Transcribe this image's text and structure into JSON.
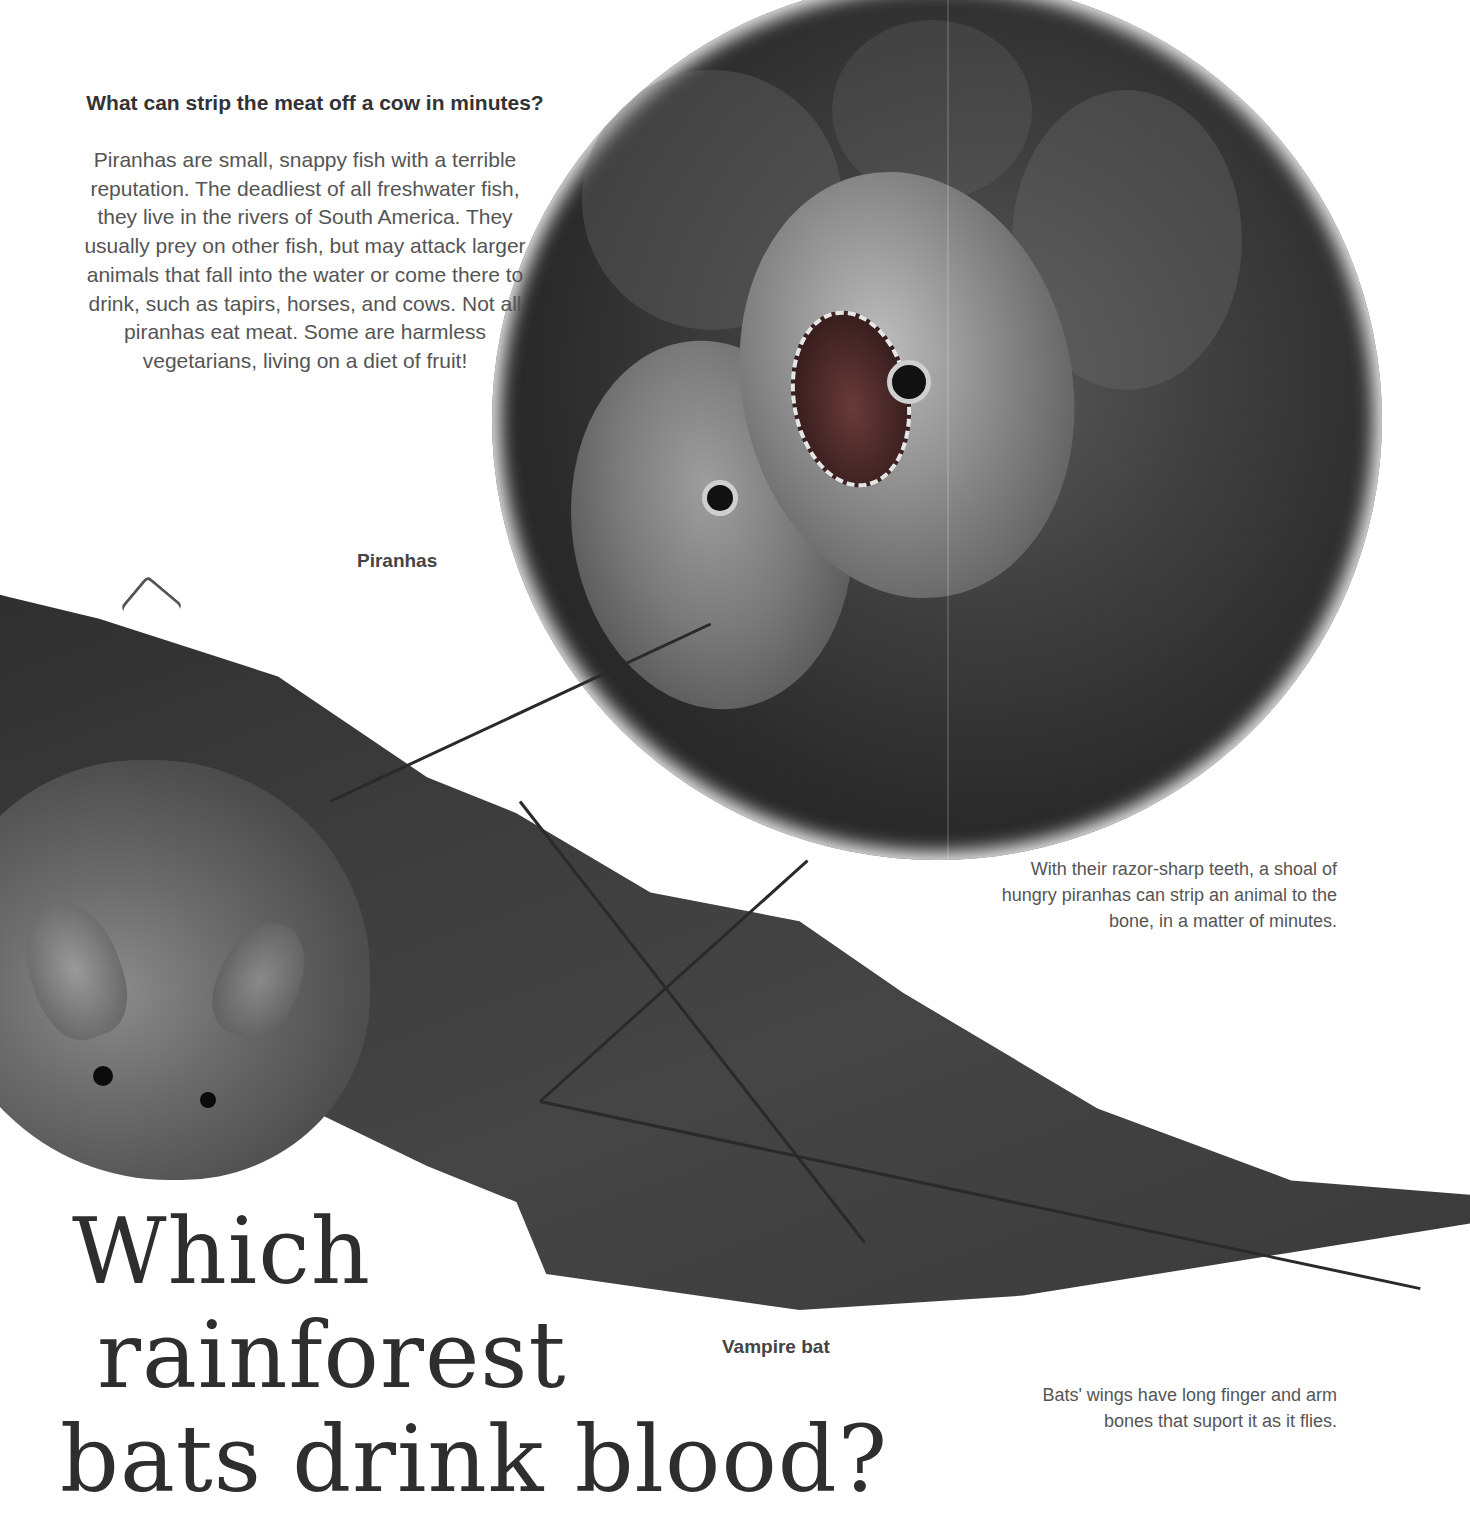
{
  "page": {
    "section": "rainforest animals",
    "piranha_question": {
      "heading": "What can strip the meat off a cow in minutes?",
      "paragraph": "Piranhas are small, snappy fish with a terrible reputation. The deadliest of all freshwater fish, they live in the rivers of South America. They usually prey on other fish, but may attack larger animals that fall into the water or come there to drink, such as tapirs, horses, and cows. Not all piranhas eat meat. Some are harmless vegetarians, living on a diet of fruit!",
      "image_label": "Piranhas",
      "image_caption": "With their razor-sharp teeth, a shoal of hungry piranhas can strip an animal to the bone, in a matter of minutes."
    },
    "bat_question": {
      "title_lines": [
        "Which",
        "rainforest",
        "bats drink blood?"
      ],
      "image_label": "Vampire bat",
      "image_caption": "Bats' wings have long finger and arm bones that suport it as it flies."
    },
    "illustrations": [
      {
        "name": "piranhas-illustration",
        "shape": "circle",
        "description": "Shoal of piranhas with open jaws"
      },
      {
        "name": "vampire-bat-illustration",
        "description": "Vampire bat with outstretched wing"
      }
    ]
  }
}
